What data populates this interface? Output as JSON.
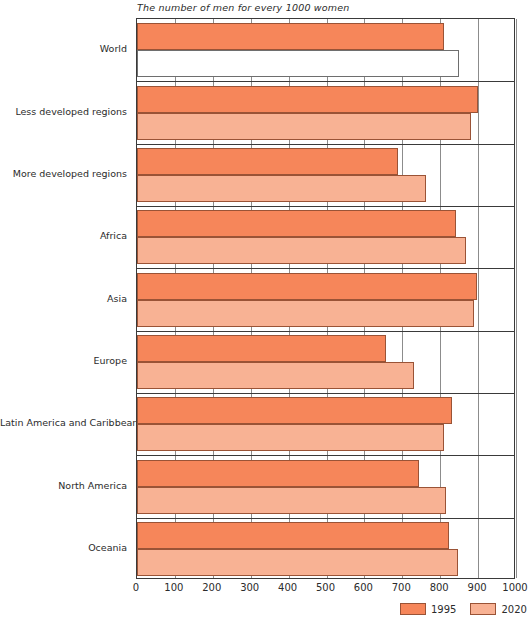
{
  "chart_data": {
    "type": "bar",
    "orientation": "horizontal",
    "title": "The number of men for every 1000 women",
    "xlabel": "",
    "ylabel": "",
    "xlim": [
      0,
      1000
    ],
    "xticks": [
      "0",
      "100",
      "200",
      "300",
      "400",
      "500",
      "600",
      "700",
      "800",
      "900",
      "1000"
    ],
    "grid": true,
    "legend_position": "bottom-right",
    "categories": [
      "World",
      "Less developed regions",
      "More developed regions",
      "Africa",
      "Asia",
      "Europe",
      "Latin America and Caribbean",
      "North America",
      "Oceania"
    ],
    "series": [
      {
        "name": "1995",
        "color": "#f6865a",
        "values": [
          810,
          900,
          689,
          842,
          897,
          657,
          830,
          745,
          824
        ]
      },
      {
        "name": "2020",
        "color": "#f8b294",
        "values": [
          850,
          880,
          763,
          868,
          888,
          731,
          810,
          816,
          847
        ]
      }
    ]
  },
  "legend": {
    "items": [
      {
        "label": "1995",
        "color": "#f6865a"
      },
      {
        "label": "2020",
        "color": "#f8b294"
      }
    ]
  }
}
